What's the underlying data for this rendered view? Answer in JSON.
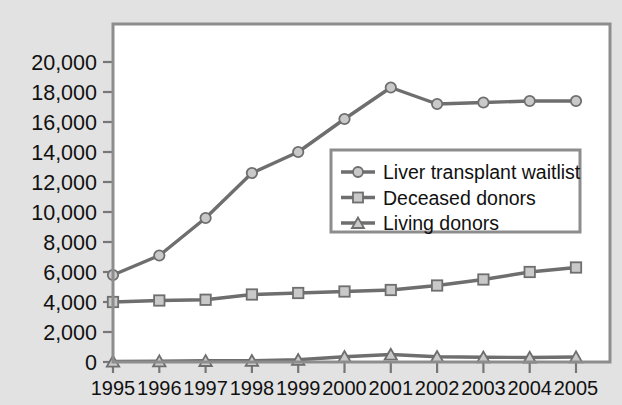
{
  "chart_data": {
    "type": "line",
    "title": "",
    "subtitle": "",
    "xlabel": "",
    "ylabel": "",
    "categories": [
      "1995",
      "1996",
      "1997",
      "1998",
      "1999",
      "2000",
      "2001",
      "2002",
      "2003",
      "2004",
      "2005"
    ],
    "x": [
      1995,
      1996,
      1997,
      1998,
      1999,
      2000,
      2001,
      2002,
      2003,
      2004,
      2005
    ],
    "series": [
      {
        "name": "Liver transplant waitlist",
        "marker": "circle",
        "color": "#6e6e6e",
        "values": [
          5800,
          7100,
          9600,
          12600,
          14000,
          16200,
          18300,
          17200,
          17300,
          17400,
          17400
        ]
      },
      {
        "name": "Deceased donors",
        "marker": "square",
        "color": "#6e6e6e",
        "values": [
          4000,
          4100,
          4150,
          4500,
          4600,
          4700,
          4800,
          5100,
          5500,
          6000,
          6300
        ]
      },
      {
        "name": "Living donors",
        "marker": "triangle",
        "color": "#6e6e6e",
        "values": [
          40,
          60,
          80,
          90,
          150,
          350,
          500,
          350,
          320,
          300,
          330
        ]
      }
    ],
    "ylim": [
      0,
      21000
    ],
    "ytick_values": [
      0,
      2000,
      4000,
      6000,
      8000,
      10000,
      12000,
      14000,
      16000,
      18000,
      20000
    ],
    "ytick_labels": [
      "0",
      "2,000",
      "4,000",
      "6,000",
      "8,000",
      "10,000",
      "12,000",
      "14,000",
      "16,000",
      "18,000",
      "20,000"
    ],
    "grid": false,
    "legend_position": "center-right-inside"
  },
  "legend": {
    "entries": [
      {
        "label": "Liver transplant waitlist",
        "marker": "circle-marker"
      },
      {
        "label": "Deceased donors",
        "marker": "square-marker"
      },
      {
        "label": "Living donors",
        "marker": "triangle-marker"
      }
    ]
  },
  "colors": {
    "background": "#e2e2e2",
    "plot_area": "#ffffff",
    "frame": "#8d8d8d",
    "series_line": "#6e6e6e",
    "marker_fill": "#c9c9c9",
    "text": "#111111"
  }
}
